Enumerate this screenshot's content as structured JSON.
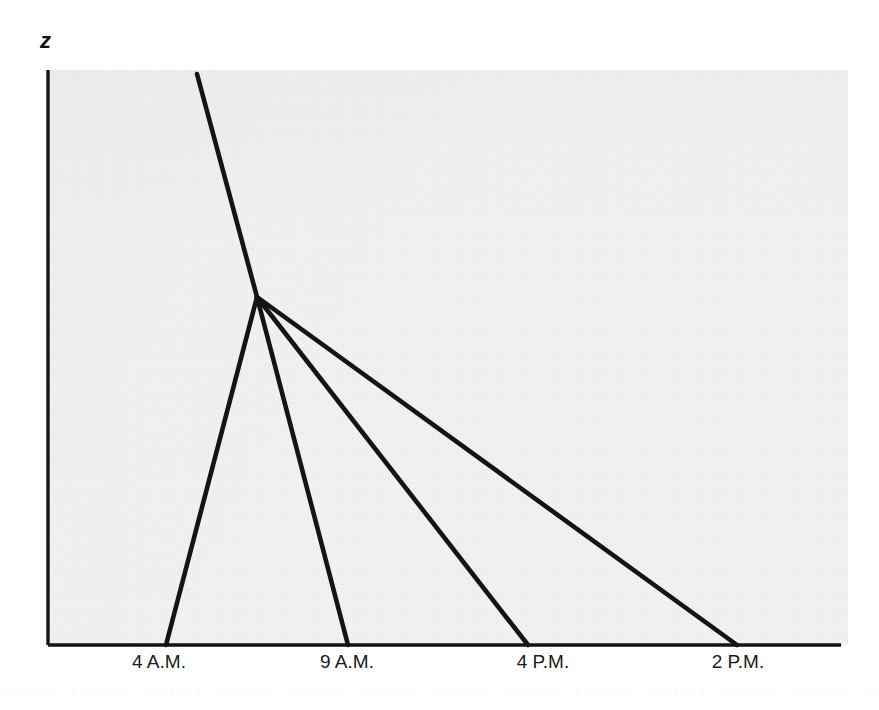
{
  "figure": {
    "background_color": "#ffffff",
    "panel_color": "#f1f1f1",
    "line_color": "#141414",
    "axis_color": "#141414",
    "y_axis_label": "z"
  },
  "chart_data": {
    "type": "line",
    "title": "",
    "subtitle": "",
    "xlabel": "",
    "ylabel": "z",
    "grid": false,
    "legend": null,
    "xlim": [
      48,
      841
    ],
    "ylim": [
      645,
      70
    ],
    "tick_labels": [
      "4 A.M.",
      "9 A.M.",
      "4 P.M.",
      "2 P.M."
    ],
    "tick_positions_px": [
      159,
      347,
      543,
      738
    ],
    "annotations": [
      {
        "name": "convergence-point",
        "x_px": 257,
        "y_px": 297,
        "label": ""
      }
    ],
    "series": [
      {
        "name": "incoming-descent",
        "points_px": [
          [
            197,
            74
          ],
          [
            257,
            297
          ]
        ]
      },
      {
        "name": "ray-4am",
        "points_px": [
          [
            257,
            297
          ],
          [
            166,
            645
          ]
        ]
      },
      {
        "name": "ray-9am",
        "points_px": [
          [
            257,
            297
          ],
          [
            348,
            645
          ]
        ]
      },
      {
        "name": "ray-4pm",
        "points_px": [
          [
            257,
            297
          ],
          [
            528,
            645
          ]
        ]
      },
      {
        "name": "ray-2pm",
        "points_px": [
          [
            257,
            297
          ],
          [
            737,
            645
          ]
        ]
      }
    ],
    "axes_px": {
      "y_axis": [
        [
          48,
          70
        ],
        [
          48,
          645
        ]
      ],
      "x_axis": [
        [
          48,
          645
        ],
        [
          841,
          645
        ]
      ]
    }
  }
}
